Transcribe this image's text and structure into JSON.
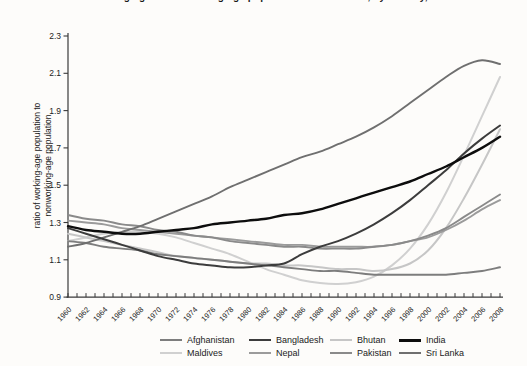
{
  "title": "Ratio of working-age to nonworking-age population in South Asia, by country, 1960–2008",
  "y_axis": {
    "label_line1": "ratio of working-age population to",
    "label_line2": "nonworking-age population",
    "ticks": [
      0.9,
      1.1,
      1.3,
      1.5,
      1.7,
      1.9,
      2.1,
      2.3
    ]
  },
  "x_axis": {
    "labeled_years": [
      1960,
      1962,
      1964,
      1966,
      1968,
      1970,
      1972,
      1974,
      1976,
      1978,
      1980,
      1982,
      1984,
      1986,
      1988,
      1990,
      1992,
      1994,
      1996,
      1998,
      2000,
      2002,
      2004,
      2006,
      2008
    ],
    "minor_tick_every_years": 1
  },
  "chart_data": {
    "type": "line",
    "title": "Ratio of working-age to nonworking-age population in South Asia, by country, 1960–2008",
    "xlabel": "",
    "ylabel": "ratio of working-age population to nonworking-age population",
    "xlim": [
      1960,
      2008
    ],
    "ylim": [
      0.9,
      2.3
    ],
    "grid": false,
    "legend_position": "bottom",
    "x": [
      1960,
      1962,
      1964,
      1966,
      1968,
      1970,
      1972,
      1974,
      1976,
      1978,
      1980,
      1982,
      1984,
      1986,
      1988,
      1990,
      1992,
      1994,
      1996,
      1998,
      2000,
      2002,
      2004,
      2006,
      2008
    ],
    "series": [
      {
        "name": "Afghanistan",
        "color": "#7d7d7d",
        "width": 1.9,
        "values": [
          1.2,
          1.19,
          1.17,
          1.16,
          1.15,
          1.13,
          1.12,
          1.11,
          1.1,
          1.09,
          1.08,
          1.07,
          1.06,
          1.05,
          1.04,
          1.04,
          1.03,
          1.02,
          1.02,
          1.02,
          1.02,
          1.02,
          1.03,
          1.04,
          1.06
        ]
      },
      {
        "name": "Bangladesh",
        "color": "#3c3c3c",
        "width": 2.0,
        "values": [
          1.27,
          1.24,
          1.21,
          1.18,
          1.15,
          1.12,
          1.1,
          1.08,
          1.07,
          1.06,
          1.06,
          1.07,
          1.08,
          1.13,
          1.17,
          1.2,
          1.24,
          1.29,
          1.35,
          1.42,
          1.5,
          1.58,
          1.67,
          1.75,
          1.82
        ]
      },
      {
        "name": "Bhutan",
        "color": "#c6c6c6",
        "width": 2.0,
        "values": [
          1.24,
          1.22,
          1.2,
          1.18,
          1.16,
          1.14,
          1.12,
          1.11,
          1.1,
          1.09,
          1.08,
          1.08,
          1.07,
          1.07,
          1.06,
          1.05,
          1.05,
          1.04,
          1.05,
          1.08,
          1.15,
          1.27,
          1.43,
          1.61,
          1.8
        ]
      },
      {
        "name": "India",
        "color": "#0d0d0d",
        "width": 2.4,
        "values": [
          1.28,
          1.26,
          1.25,
          1.24,
          1.24,
          1.25,
          1.26,
          1.27,
          1.29,
          1.3,
          1.31,
          1.32,
          1.34,
          1.35,
          1.37,
          1.4,
          1.43,
          1.46,
          1.49,
          1.52,
          1.56,
          1.6,
          1.65,
          1.7,
          1.76
        ]
      },
      {
        "name": "Maldives",
        "color": "#d0d0d0",
        "width": 2.0,
        "values": [
          1.2,
          1.22,
          1.24,
          1.25,
          1.25,
          1.24,
          1.22,
          1.19,
          1.16,
          1.13,
          1.09,
          1.05,
          1.02,
          0.99,
          0.975,
          0.97,
          0.98,
          1.01,
          1.07,
          1.16,
          1.29,
          1.46,
          1.66,
          1.87,
          2.08
        ]
      },
      {
        "name": "Nepal",
        "color": "#9b9b9b",
        "width": 1.9,
        "values": [
          1.31,
          1.3,
          1.29,
          1.27,
          1.26,
          1.25,
          1.24,
          1.23,
          1.22,
          1.21,
          1.2,
          1.19,
          1.18,
          1.18,
          1.17,
          1.17,
          1.17,
          1.17,
          1.18,
          1.2,
          1.22,
          1.26,
          1.31,
          1.37,
          1.42
        ]
      },
      {
        "name": "Pakistan",
        "color": "#8a8a8a",
        "width": 1.9,
        "values": [
          1.34,
          1.32,
          1.31,
          1.29,
          1.28,
          1.26,
          1.25,
          1.23,
          1.22,
          1.2,
          1.19,
          1.18,
          1.17,
          1.17,
          1.16,
          1.16,
          1.16,
          1.17,
          1.18,
          1.2,
          1.23,
          1.27,
          1.33,
          1.39,
          1.45
        ]
      },
      {
        "name": "Sri Lanka",
        "color": "#6f6f6f",
        "width": 1.9,
        "values": [
          1.17,
          1.19,
          1.22,
          1.25,
          1.28,
          1.32,
          1.36,
          1.4,
          1.44,
          1.49,
          1.53,
          1.57,
          1.61,
          1.65,
          1.68,
          1.72,
          1.76,
          1.81,
          1.87,
          1.94,
          2.01,
          2.08,
          2.14,
          2.17,
          2.15
        ]
      }
    ],
    "draw_order": [
      "Maldives",
      "Bhutan",
      "Nepal",
      "Pakistan",
      "Afghanistan",
      "Sri Lanka",
      "Bangladesh",
      "India"
    ]
  },
  "style": {
    "axis_color": "#3a3a3a",
    "tick_label_color": "#222222"
  }
}
